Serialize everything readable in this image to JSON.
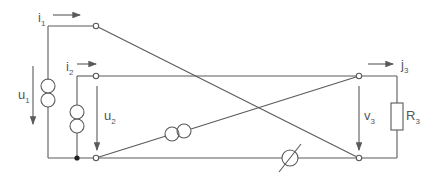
{
  "diagram": {
    "type": "circuit",
    "labels": {
      "i1": {
        "main": "i",
        "sub": "1"
      },
      "i2": {
        "main": "i",
        "sub": "2"
      },
      "j3": {
        "main": "j",
        "sub": "3"
      },
      "u1": {
        "main": "u",
        "sub": "1"
      },
      "u2": {
        "main": "u",
        "sub": "2"
      },
      "v3": {
        "main": "v",
        "sub": "3"
      },
      "R3": {
        "main": "R",
        "sub": "3"
      }
    },
    "components": [
      {
        "name": "transformer-left-1",
        "kind": "transformer"
      },
      {
        "name": "transformer-left-2",
        "kind": "transformer"
      },
      {
        "name": "transformer-diagonal",
        "kind": "transformer"
      },
      {
        "name": "variable-element",
        "kind": "variable-resistor-or-meter"
      },
      {
        "name": "resistor-R3",
        "kind": "resistor"
      },
      {
        "name": "junction-node",
        "kind": "node"
      }
    ],
    "colors": {
      "stroke": "#5a5a5a",
      "text": "#555555"
    }
  }
}
